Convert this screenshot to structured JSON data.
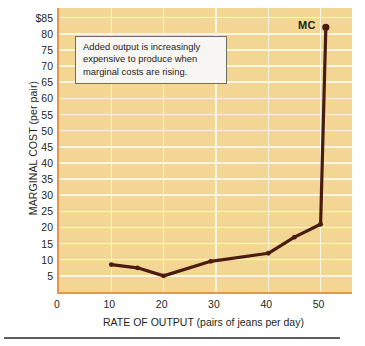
{
  "chart_data": {
    "type": "line",
    "title": "",
    "xlabel": "RATE OF OUTPUT (pairs of jeans per day)",
    "ylabel": "MARGINAL COST (per pair)",
    "xlim": [
      0,
      56
    ],
    "ylim": [
      0,
      88
    ],
    "grid": true,
    "legend_position": "inline-right",
    "x_ticks": [
      0,
      10,
      20,
      30,
      40,
      50
    ],
    "x_tick_labels": [
      "0",
      "10",
      "20",
      "30",
      "40",
      "50"
    ],
    "y_ticks": [
      5,
      10,
      15,
      20,
      25,
      30,
      35,
      40,
      45,
      50,
      55,
      60,
      65,
      70,
      75,
      80,
      85
    ],
    "y_tick_labels": [
      "5",
      "10",
      "15",
      "20",
      "25",
      "30",
      "35",
      "40",
      "45",
      "50",
      "55",
      "60",
      "65",
      "70",
      "75",
      "80",
      "$85"
    ],
    "series": [
      {
        "name": "MC",
        "label": "MC",
        "color": "#4a1c10",
        "x": [
          10,
          15,
          20,
          29,
          40,
          45,
          50,
          51
        ],
        "values": [
          8.5,
          7.5,
          5,
          9.5,
          12,
          17,
          21,
          82
        ]
      }
    ],
    "annotations": [
      {
        "name": "callout",
        "lines": [
          "Added output is increasingly",
          "expensive to produce when",
          "marginal costs are rising."
        ]
      }
    ],
    "colors": {
      "plot_background": "#f4d694",
      "gridline": "#fdf6e4",
      "axis": "#e8954a",
      "curve": "#4a1c10",
      "text": "#231f20",
      "annotation_background": "#f7f6f2",
      "annotation_border": "#6f6d6a",
      "page_background": "#ffffff",
      "rule": "#5d5d5d"
    }
  }
}
